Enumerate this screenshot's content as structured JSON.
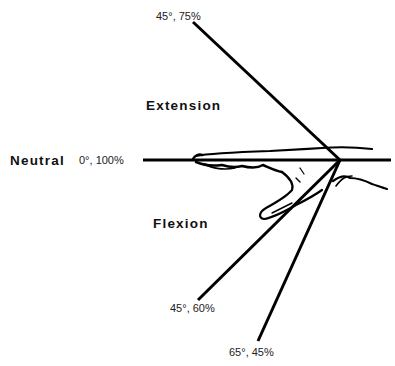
{
  "diagram": {
    "labels": {
      "neutral": "Neutral",
      "extension": "Extension",
      "flexion": "Flexion"
    },
    "angles": [
      {
        "name": "neutral",
        "text": "0°, 100%"
      },
      {
        "name": "extension-45",
        "text": "45°, 75%"
      },
      {
        "name": "flexion-45",
        "text": "45°, 60%"
      },
      {
        "name": "flexion-65",
        "text": "65°, 45%"
      }
    ],
    "colors": {
      "line": "#000000",
      "background": "#ffffff"
    }
  }
}
